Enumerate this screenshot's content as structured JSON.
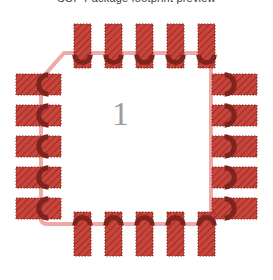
{
  "view": {
    "background_color": "#ffffff",
    "clipped_header_text": "SOP Package footprint preview",
    "reference_designator": "1",
    "refdes_color": "#9c9c9c",
    "refdes_x": 112,
    "refdes_y": 97
  },
  "colors": {
    "pad_fill": "#c8453c",
    "pad_hatch": "#9e2e27",
    "pad_border": "#8f2a23",
    "pad_notch": "#7e241e",
    "courtyard": "#f0a9a6",
    "silkscreen": "#f0a9a6"
  },
  "footprint": {
    "name": "QFN-20",
    "pin_count": 20,
    "courtyard": {
      "left": 41,
      "top": 53,
      "right": 211,
      "bottom": 224,
      "stroke_width": 4,
      "chamfer": {
        "corner": "top-left",
        "x1": 41,
        "y1": 79,
        "x2": 64,
        "y2": 53
      }
    },
    "pad_rows": [
      {
        "side": "top",
        "orientation": "vertical",
        "notch": "bottom",
        "count": 5,
        "pad_width": 17,
        "pad_height": 44,
        "y": 24,
        "x_positions": [
          74,
          105,
          136,
          167,
          198
        ]
      },
      {
        "side": "left",
        "orientation": "horizontal",
        "notch": "right",
        "count": 5,
        "pad_width": 45,
        "pad_height": 21,
        "x": 16,
        "y_positions": [
          74,
          105,
          136,
          167,
          198
        ]
      },
      {
        "side": "right",
        "orientation": "horizontal",
        "notch": "left",
        "count": 5,
        "pad_width": 45,
        "pad_height": 21,
        "x": 212,
        "y_positions": [
          74,
          105,
          136,
          167,
          198
        ]
      },
      {
        "side": "bottom",
        "orientation": "vertical",
        "notch": "top",
        "count": 5,
        "pad_width": 17,
        "pad_height": 44,
        "y": 212,
        "x_positions": [
          74,
          105,
          136,
          167,
          198
        ]
      }
    ]
  }
}
